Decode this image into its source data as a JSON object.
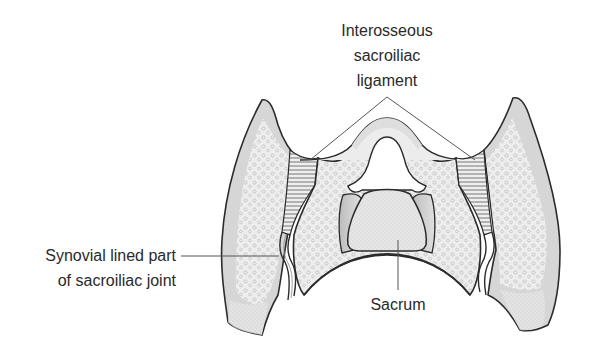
{
  "diagram": {
    "labels": {
      "interosseous": [
        "Interosseous",
        "sacroiliac",
        "ligament"
      ],
      "synovial": [
        "Synovial lined part",
        "of sacroiliac joint"
      ],
      "sacrum": "Sacrum"
    },
    "colors": {
      "outline": "#2b2b2b",
      "cortex": "#d9d9d9",
      "cancellous": "#ececec",
      "cancellous_dots": "#bdbdbd",
      "shadow": "#c4c4c4",
      "leader": "#555555",
      "background": "#ffffff"
    }
  }
}
